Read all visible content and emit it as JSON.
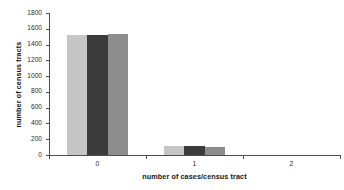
{
  "chart_data": {
    "type": "bar",
    "title": "",
    "subtitle": "",
    "xlabel": "number of cases/census tract",
    "ylabel": "number of census tracts",
    "categories": [
      "0",
      "1",
      "2"
    ],
    "series": [
      {
        "name": "series-1",
        "color": "#c6c6c6",
        "values": [
          1520,
          110,
          0
        ]
      },
      {
        "name": "series-2",
        "color": "#3b3b3b",
        "values": [
          1515,
          110,
          0
        ]
      },
      {
        "name": "series-3",
        "color": "#8d8d8d",
        "values": [
          1530,
          105,
          0
        ]
      }
    ],
    "ylim": [
      0,
      1800
    ],
    "ytick_values": [
      0,
      200,
      400,
      600,
      800,
      1000,
      1200,
      1400,
      1600,
      1800
    ],
    "ytick_labels": [
      "0",
      "200",
      "400",
      "600",
      "800",
      "1000",
      "1200",
      "1400",
      "1600",
      "1800"
    ],
    "xtick_labels": [
      "0",
      "1",
      "2"
    ],
    "grid": false,
    "legend": false,
    "legend_position": "none",
    "background_color": "#ffffff",
    "axis_color": "#4d4d4d"
  }
}
